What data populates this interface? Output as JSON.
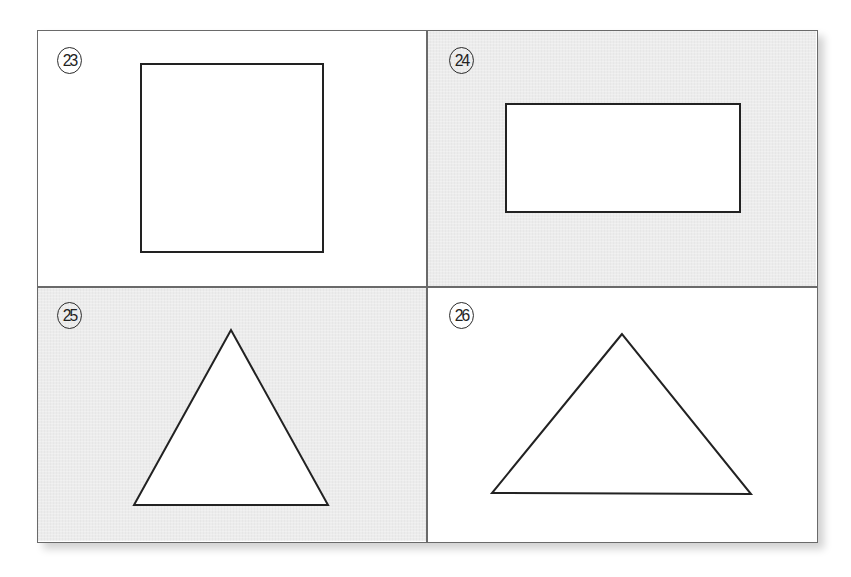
{
  "figure": {
    "panels": [
      {
        "id": "23",
        "label": "㉓",
        "shape": "square",
        "background": "#ffffff"
      },
      {
        "id": "24",
        "label": "㉔",
        "shape": "rectangle",
        "background": "#ececec"
      },
      {
        "id": "25",
        "label": "㉕",
        "shape": "equilateral-triangle",
        "background": "#ececec"
      },
      {
        "id": "26",
        "label": "㉖",
        "shape": "wide-triangle",
        "background": "#ffffff"
      }
    ],
    "colors": {
      "frame": "#6a6a6a",
      "stroke": "#222222",
      "shape_fill": "#ffffff",
      "gray_panel": "#ececec"
    }
  }
}
